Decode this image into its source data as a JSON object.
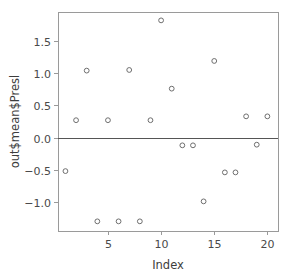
{
  "chart_data": {
    "type": "scatter",
    "title": "",
    "xlabel": "Index",
    "ylabel": "out$mean$Presl",
    "xlim": [
      0.3,
      21.0
    ],
    "ylim": [
      -1.45,
      1.95
    ],
    "xticks": [
      5,
      10,
      15,
      20
    ],
    "xtick_labels": [
      "5",
      "10",
      "15",
      "20"
    ],
    "yticks": [
      -1.0,
      -0.5,
      0.0,
      0.5,
      1.0,
      1.5
    ],
    "ytick_labels": [
      "-1.0",
      "-0.5",
      "0.0",
      "0.5",
      "1.0",
      "1.5"
    ],
    "grid": false,
    "legend": "none",
    "marker": "open-circle",
    "marker_color": "#6e6e6e",
    "reference_line": {
      "orientation": "horizontal",
      "y": 0.0,
      "color": "#555555"
    },
    "x": [
      1,
      2,
      3,
      4,
      5,
      6,
      7,
      8,
      9,
      10,
      11,
      12,
      13,
      14,
      15,
      16,
      17,
      18,
      19,
      20
    ],
    "y": [
      -0.52,
      0.27,
      1.04,
      -1.3,
      0.27,
      -1.3,
      1.05,
      -1.3,
      0.27,
      1.82,
      0.76,
      -0.12,
      -0.12,
      -0.99,
      1.19,
      -0.54,
      -0.54,
      0.33,
      -0.11,
      0.33
    ],
    "points": [
      {
        "index": 1,
        "value": -0.52
      },
      {
        "index": 2,
        "value": 0.27
      },
      {
        "index": 3,
        "value": 1.04
      },
      {
        "index": 4,
        "value": -1.3
      },
      {
        "index": 5,
        "value": 0.27
      },
      {
        "index": 6,
        "value": -1.3
      },
      {
        "index": 7,
        "value": 1.05
      },
      {
        "index": 8,
        "value": -1.3
      },
      {
        "index": 9,
        "value": 0.27
      },
      {
        "index": 10,
        "value": 1.82
      },
      {
        "index": 11,
        "value": 0.76
      },
      {
        "index": 12,
        "value": -0.12
      },
      {
        "index": 13,
        "value": -0.12
      },
      {
        "index": 14,
        "value": -0.99
      },
      {
        "index": 15,
        "value": 1.19
      },
      {
        "index": 16,
        "value": -0.54
      },
      {
        "index": 17,
        "value": -0.54
      },
      {
        "index": 18,
        "value": 0.33
      },
      {
        "index": 19,
        "value": -0.11
      },
      {
        "index": 20,
        "value": 0.33
      }
    ]
  },
  "plot_geometry": {
    "frame_left": 58,
    "frame_right": 278,
    "frame_top": 12,
    "frame_bottom": 231,
    "marker_radius": 2.4
  }
}
